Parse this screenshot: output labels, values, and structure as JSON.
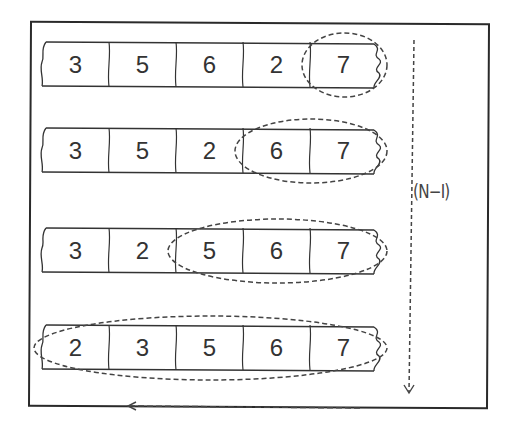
{
  "diagram": {
    "title": "",
    "rows": [
      {
        "values": [
          "3",
          "5",
          "6",
          "2",
          "7"
        ],
        "sorted_count": 1
      },
      {
        "values": [
          "3",
          "5",
          "2",
          "6",
          "7"
        ],
        "sorted_count": 2
      },
      {
        "values": [
          "3",
          "2",
          "5",
          "6",
          "7"
        ],
        "sorted_count": 3
      },
      {
        "values": [
          "2",
          "3",
          "5",
          "6",
          "7"
        ],
        "sorted_count": 5
      }
    ],
    "side_label": "(N−I)",
    "arrows": [
      {
        "name": "vertical-down-arrow",
        "direction": "down"
      },
      {
        "name": "horizontal-left-arrow",
        "direction": "left"
      }
    ],
    "colors": {
      "stroke": "#333333",
      "background": "#ffffff",
      "dash": "#444444"
    }
  }
}
